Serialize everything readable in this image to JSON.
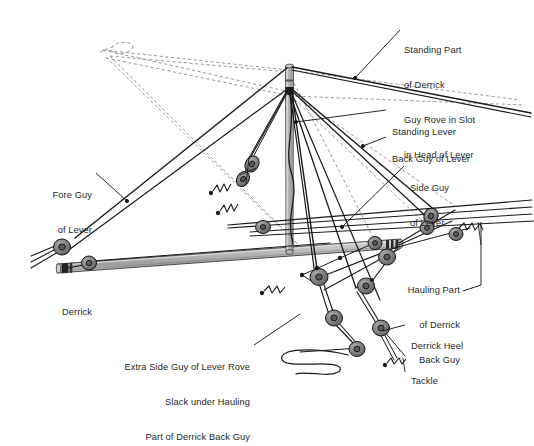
{
  "diagram": {
    "background_color": "#ffffff",
    "line_color": "#1a1a1a",
    "dashed_line_color": "#8d8d8d",
    "spar_fill": "#b0b0b0",
    "block_fill": "#7a7a7a",
    "block_stroke": "#1a1a1a"
  },
  "labels": {
    "standing_part": {
      "lines": [
        "Standing Part",
        "of Derrick",
        "Guy Rove in Slot",
        "in Head of Lever"
      ],
      "align": "left"
    },
    "standing_lever": {
      "lines": [
        "Standing Lever"
      ],
      "align": "left"
    },
    "back_guy": {
      "lines": [
        "Back Guy of Lever"
      ],
      "align": "left"
    },
    "side_guy": {
      "lines": [
        "Side Guy",
        "of Lever"
      ],
      "align": "left"
    },
    "fore_guy": {
      "lines": [
        "Fore Guy",
        "of Lever"
      ],
      "align": "right"
    },
    "derrick": {
      "lines": [
        "Derrick"
      ],
      "align": "left"
    },
    "hauling_part": {
      "lines": [
        "Hauling Part",
        "of Derrick",
        "Back Guy"
      ],
      "align": "right"
    },
    "derrick_heel_tackle": {
      "lines": [
        "Derrick Heel",
        "Tackle"
      ],
      "align": "left"
    },
    "extra_side_guy": {
      "lines": [
        "Extra Side Guy of Lever Rove",
        "Slack under Hauling",
        "Part of Derrick Back Guy"
      ],
      "align": "right"
    }
  },
  "components": {
    "mast_name": "standing-lever-mast",
    "boom_name": "derrick-boom",
    "blocks_count": 16,
    "tackle_names": [
      "lever-fore-tackle",
      "lever-back-tackle",
      "derrick-heel-tackle",
      "side-guy-tackle",
      "hauling-part-tackle"
    ]
  }
}
